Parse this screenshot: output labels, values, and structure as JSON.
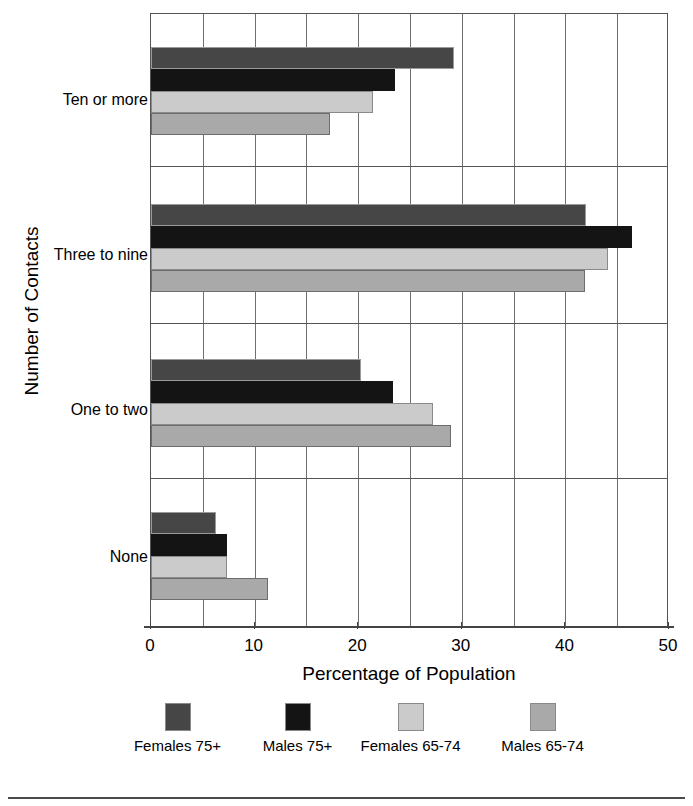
{
  "chart_data": {
    "type": "bar",
    "orientation": "horizontal",
    "title": "",
    "xlabel": "Percentage of Population",
    "ylabel": "Number of Contacts",
    "categories": [
      "None",
      "One to two",
      "Three to nine",
      "Ten or more"
    ],
    "series": [
      {
        "name": "Females 75+",
        "color": "#464646",
        "values": [
          6.3,
          20.3,
          42.0,
          29.2
        ]
      },
      {
        "name": "Males 75+",
        "color": "#141414",
        "values": [
          7.3,
          23.4,
          46.4,
          23.5
        ]
      },
      {
        "name": "Females 65-74",
        "color": "#cbcbcb",
        "values": [
          7.3,
          27.2,
          44.1,
          21.4
        ]
      },
      {
        "name": "Males 65-74",
        "color": "#a9a9a9",
        "values": [
          11.3,
          29.0,
          41.9,
          17.3
        ]
      }
    ],
    "xlim": [
      0,
      50
    ],
    "xticks": [
      0,
      10,
      20,
      30,
      40,
      50
    ],
    "xtick_labels": [
      "0",
      "10",
      "20",
      "30",
      "40",
      "50"
    ],
    "gridline_step": 5,
    "grid": true,
    "legend_position": "bottom"
  },
  "axis": {
    "x_title": "Percentage of Population",
    "y_title": "Number of Contacts",
    "x_tick_labels": [
      "0",
      "10",
      "20",
      "30",
      "40",
      "50"
    ],
    "y_category_labels": [
      "Ten or more",
      "Three to nine",
      "One to two",
      "None"
    ]
  },
  "legend": {
    "items": [
      {
        "label": "Females 75+"
      },
      {
        "label": "Males 75+"
      },
      {
        "label": "Females 65-74"
      },
      {
        "label": "Males 65-74"
      }
    ]
  }
}
